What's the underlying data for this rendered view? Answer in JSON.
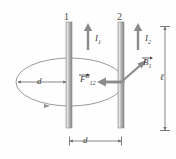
{
  "figure": {
    "type": "physics-diagram",
    "background_color": "#ffffff",
    "wire_color": "#9a9a9a",
    "line_color": "#6b6b6b",
    "text_color": "#3b3b3b",
    "arrow_color": "#7d7d7d"
  },
  "wires": [
    {
      "id": "wire-1",
      "number_label": "1",
      "current_label": "I",
      "current_subscript": "1",
      "current_direction": "up",
      "x": 69,
      "top": 22,
      "bottom": 128
    },
    {
      "id": "wire-2",
      "number_label": "2",
      "current_label": "I",
      "current_subscript": "2",
      "current_direction": "up",
      "x": 121,
      "top": 22,
      "bottom": 128
    }
  ],
  "vectors": {
    "magnetic_field": {
      "symbol": "B",
      "subscript": "1",
      "has_vector_arrow": true,
      "direction": "up-right",
      "origin_x": 121,
      "origin_y": 82
    },
    "force": {
      "symbol": "F",
      "superscript": "B",
      "subscript": "12",
      "has_vector_arrow": true,
      "direction": "left",
      "from_x": 121,
      "to_x": 98,
      "y": 82
    }
  },
  "field_line": {
    "name": "circular-field-line-ellipse",
    "shape": "ellipse",
    "center_x": 70,
    "center_y": 82,
    "radius_x": 54,
    "radius_y": 24,
    "direction_arrow": "counterclockwise-marker-bottom-left"
  },
  "dimensions": [
    {
      "id": "radius-d",
      "label": "d",
      "orientation": "horizontal",
      "from_x": 17,
      "to_x": 69,
      "y": 82,
      "description": "radius from field line edge to wire 1"
    },
    {
      "id": "separation-d",
      "label": "d",
      "orientation": "horizontal",
      "from_x": 69,
      "to_x": 121,
      "y": 141,
      "description": "separation between wire 1 and wire 2"
    },
    {
      "id": "length-ell",
      "label": "ℓ",
      "orientation": "vertical",
      "x": 165,
      "from_y": 26,
      "to_y": 130,
      "description": "wire length"
    }
  ]
}
